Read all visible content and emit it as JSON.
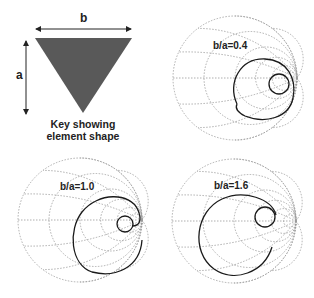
{
  "key": {
    "width_label": "b",
    "height_label": "a",
    "caption_line1": "Key showing",
    "caption_line2": "element shape",
    "shape_color": "#595959"
  },
  "charts": [
    {
      "label": "b/a=0.4",
      "position": "top-right"
    },
    {
      "label": "b/a=1.0",
      "position": "bottom-left"
    },
    {
      "label": "b/a=1.6",
      "position": "bottom-right"
    }
  ],
  "colors": {
    "grid": "#9a9a9a",
    "trace": "#1a1a1a",
    "text": "#222222"
  }
}
